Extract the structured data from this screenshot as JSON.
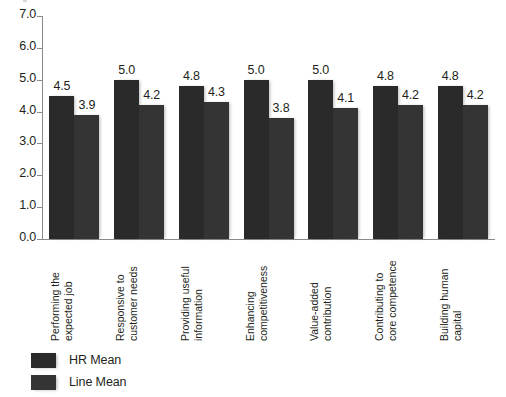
{
  "chart_data": {
    "type": "bar",
    "title": "",
    "subtitle": "",
    "xlabel": "",
    "ylabel": "",
    "ylim": [
      0.0,
      7.0
    ],
    "ytick_step": 1.0,
    "ytick_labels": [
      "7.0",
      "6.0",
      "5.0",
      "4.0",
      "3.0",
      "2.0",
      "1.0",
      "0.0"
    ],
    "ytick_values": [
      7.0,
      6.0,
      5.0,
      4.0,
      3.0,
      2.0,
      1.0,
      0.0
    ],
    "grid": false,
    "legend_position": "bottom-left",
    "categories": [
      "Performing the\nexpected job",
      "Responsive to\ncustomer needs",
      "Providing useful\ninformation",
      "Enhancing\ncompetitiveness",
      "Value-added\ncontribution",
      "Contributing to\ncore competence",
      "Building human\ncapital"
    ],
    "series": [
      {
        "name": "HR Mean",
        "color": "#2a2a2a",
        "values": [
          4.5,
          5.0,
          4.8,
          5.0,
          5.0,
          4.8,
          4.8
        ],
        "labels": [
          "4.5",
          "5.0",
          "4.8",
          "5.0",
          "5.0",
          "4.8",
          "4.8"
        ]
      },
      {
        "name": "Line Mean",
        "color": "#343434",
        "values": [
          3.9,
          4.2,
          4.3,
          3.8,
          4.1,
          4.2,
          4.2
        ],
        "labels": [
          "3.9",
          "4.2",
          "4.3",
          "3.8",
          "4.1",
          "4.2",
          "4.2"
        ]
      }
    ]
  },
  "legend": {
    "items": [
      {
        "label": "HR Mean"
      },
      {
        "label": "Line Mean"
      }
    ]
  }
}
